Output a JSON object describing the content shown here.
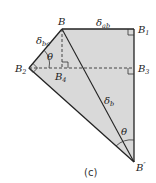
{
  "diagram": {
    "caption": "(c)",
    "fill_color": "#d9d9d9",
    "stroke_color": "#222222",
    "points": {
      "B": {
        "label": "B",
        "sub": ""
      },
      "B1": {
        "label": "B",
        "sub": "1"
      },
      "B2": {
        "label": "B",
        "sub": "2"
      },
      "B3": {
        "label": "B",
        "sub": "3"
      },
      "B4": {
        "label": "B",
        "sub": "4"
      },
      "Bpp": {
        "label": "B",
        "sup": "″"
      }
    },
    "lengths": {
      "ab": {
        "label": "δ",
        "sub": "ab"
      },
      "bc": {
        "label": "δ",
        "sub": "bc"
      },
      "b": {
        "label": "δ",
        "sub": "b"
      }
    },
    "angles": {
      "theta_top": "θ",
      "theta_bottom": "θ"
    }
  }
}
